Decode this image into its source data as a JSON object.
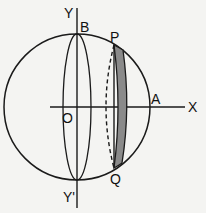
{
  "diagram": {
    "labels": {
      "Y": "Y",
      "Y_prime": "Y'",
      "B": "B",
      "P": "P",
      "O": "O",
      "A": "A",
      "X": "X",
      "Q": "Q"
    },
    "colors": {
      "stroke": "#1a1a1a",
      "shade": "#8a8a8a",
      "background": "#f4f4f2"
    }
  }
}
